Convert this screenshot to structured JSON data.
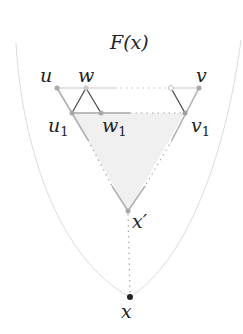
{
  "diagram": {
    "title": "F(x)",
    "colors": {
      "boundary": "#dcdcdc",
      "edge_light": "#c8c8c8",
      "edge_mid": "#a8a8a8",
      "edge_dark": "#444444",
      "dots": "#a0a0a0",
      "fill": "#f0f0f0",
      "point": "#a0a0a0",
      "root": "#222222"
    },
    "nodes": [
      {
        "id": "u",
        "label": "u",
        "sub": "",
        "x": 57,
        "y": 88
      },
      {
        "id": "w",
        "label": "w",
        "sub": "",
        "x": 86,
        "y": 88
      },
      {
        "id": "v",
        "label": "v",
        "sub": "",
        "x": 199,
        "y": 88
      },
      {
        "id": "u1",
        "label": "u",
        "sub": "1",
        "x": 72,
        "y": 113
      },
      {
        "id": "w1",
        "label": "w",
        "sub": "1",
        "x": 101,
        "y": 113
      },
      {
        "id": "v1",
        "label": "v",
        "sub": "1",
        "x": 185,
        "y": 113
      },
      {
        "id": "xp",
        "label": "x′",
        "sub": "",
        "x": 128,
        "y": 211
      },
      {
        "id": "x",
        "label": "x",
        "sub": "",
        "x": 130,
        "y": 297
      }
    ],
    "open_node": {
      "x": 171,
      "y": 88
    }
  }
}
